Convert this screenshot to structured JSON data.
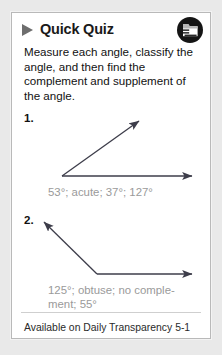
{
  "card": {
    "header": {
      "title": "Quick Quiz",
      "play_icon": "play-triangle-icon",
      "corner_icon": "folder-icon"
    },
    "instructions": "Measure each angle, classify the angle, and then find the complement and supplement of the angle.",
    "questions": [
      {
        "number": "1.",
        "figure": {
          "type": "acute-angle",
          "vertex": [
            38,
            64
          ],
          "ray_horizontal_end": [
            172,
            64
          ],
          "ray_diagonal_end": [
            118,
            6
          ],
          "angle_degrees": 53
        },
        "answer": "53°; acute; 37°; 127°"
      },
      {
        "number": "2.",
        "figure": {
          "type": "obtuse-angle",
          "vertex": [
            73,
            60
          ],
          "ray_horizontal_end": [
            172,
            60
          ],
          "ray_diagonal_end": [
            17,
            6
          ],
          "angle_degrees": 125
        },
        "answer": "125°; obtuse; no comple-ment; 55°"
      }
    ],
    "footer": "Available on Daily Transparency 5-1"
  },
  "colors": {
    "page_background": "#e9e9e9",
    "card_background": "#ffffff",
    "card_border": "#b9b9b9",
    "title_text": "#1a1a1a",
    "body_text": "#111111",
    "answer_text": "#9a9a9a",
    "icon_circle": "#151515",
    "stroke": "#3d3d4a",
    "divider": "#cfcfcf"
  }
}
